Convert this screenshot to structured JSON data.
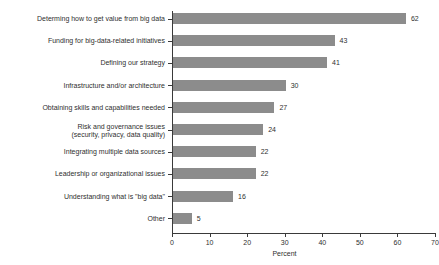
{
  "chart_data": {
    "type": "bar",
    "orientation": "horizontal",
    "title": "",
    "xlabel": "Percent",
    "ylabel": "",
    "xlim": [
      0,
      70
    ],
    "xticks": [
      0,
      10,
      20,
      30,
      40,
      50,
      60,
      70
    ],
    "grid": false,
    "legend": false,
    "bar_color": "#8c8c8c",
    "categories": [
      "Determing how to get value from big data",
      "Funding for big-data-related initiatives",
      "Defining our strategy",
      "Infrastructure and/or architecture",
      "Obtaining skills and capabilities needed",
      "Risk and governance issues\n(security, privacy, data quality)",
      "Integrating multiple data sources",
      "Leadership or organizational issues",
      "Understanding what is \"big data\"",
      "Other"
    ],
    "values": [
      62,
      43,
      41,
      30,
      27,
      24,
      22,
      22,
      16,
      5
    ],
    "value_labels": [
      "62",
      "43",
      "41",
      "30",
      "27",
      "24",
      "22",
      "22",
      "16",
      "5"
    ]
  }
}
